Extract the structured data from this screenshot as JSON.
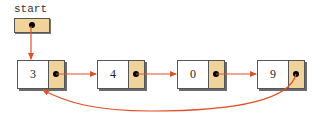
{
  "diagram": {
    "start_label": "start",
    "nodes": [
      {
        "value": "3"
      },
      {
        "value": "4"
      },
      {
        "value": "0"
      },
      {
        "value": "9"
      }
    ],
    "colors": {
      "pointer_cell": "#efd39a",
      "arrow": "#e0522a",
      "border": "#555555"
    }
  }
}
